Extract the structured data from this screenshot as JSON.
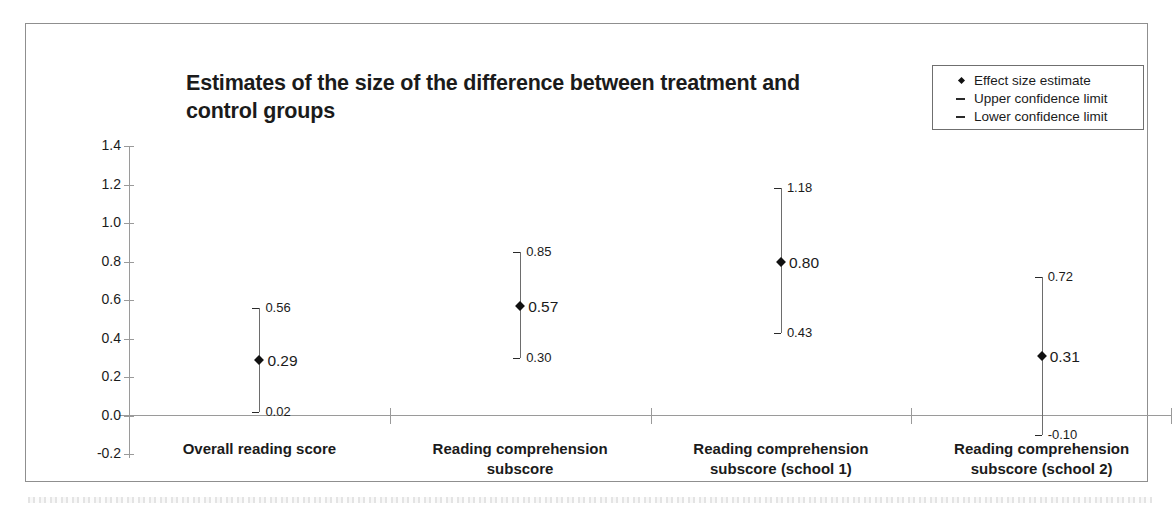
{
  "chart_data": {
    "type": "scatter",
    "title": "Estimates of the size of the difference between treatment and control groups",
    "xlabel": "",
    "ylabel": "Standardised Effect Size",
    "ylim": [
      -0.2,
      1.4
    ],
    "y_ticks": [
      "1.4",
      "1.2",
      "1.0",
      "0.8",
      "0.6",
      "0.4",
      "0.2",
      "0.0",
      "-0.2"
    ],
    "y_tick_values": [
      1.4,
      1.2,
      1.0,
      0.8,
      0.6,
      0.4,
      0.2,
      0.0,
      -0.2
    ],
    "grid": false,
    "legend_position": "top-right",
    "categories": [
      "Overall reading score",
      "Reading comprehension subscore",
      "Reading comprehension subscore (school 1)",
      "Reading comprehension subscore (school 2)"
    ],
    "category_lines": [
      [
        "Overall reading score"
      ],
      [
        "Reading comprehension",
        "subscore"
      ],
      [
        "Reading comprehension",
        "subscore (school 1)"
      ],
      [
        "Reading comprehension",
        "subscore (school 2)"
      ]
    ],
    "series": [
      {
        "name": "Effect size estimate",
        "values": [
          0.29,
          0.57,
          0.8,
          0.31
        ]
      },
      {
        "name": "Upper confidence limit",
        "values": [
          0.56,
          0.85,
          1.18,
          0.72
        ]
      },
      {
        "name": "Lower confidence limit",
        "values": [
          0.02,
          0.3,
          0.43,
          -0.1
        ]
      }
    ],
    "points": [
      {
        "category": "Overall reading score",
        "estimate": 0.29,
        "upper": 0.56,
        "lower": 0.02,
        "estimate_label": "0.29",
        "upper_label": "0.56",
        "lower_label": "0.02"
      },
      {
        "category": "Reading comprehension subscore",
        "estimate": 0.57,
        "upper": 0.85,
        "lower": 0.3,
        "estimate_label": "0.57",
        "upper_label": "0.85",
        "lower_label": "0.30"
      },
      {
        "category": "Reading comprehension subscore (school 1)",
        "estimate": 0.8,
        "upper": 1.18,
        "lower": 0.43,
        "estimate_label": "0.80",
        "upper_label": "1.18",
        "lower_label": "0.43"
      },
      {
        "category": "Reading comprehension subscore (school 2)",
        "estimate": 0.31,
        "upper": 0.72,
        "lower": -0.1,
        "estimate_label": "0.31",
        "upper_label": "0.72",
        "lower_label": "-0.10"
      }
    ],
    "legend": [
      {
        "key": "diamond",
        "label": "Effect size estimate"
      },
      {
        "key": "dash",
        "label": "Upper confidence limit"
      },
      {
        "key": "dash",
        "label": "Lower confidence limit"
      }
    ],
    "colors": {
      "marker": "#111111",
      "line": "#6d6d6d",
      "axis": "#9a9a9a",
      "text": "#1b1b1b",
      "background": "#ffffff"
    }
  }
}
